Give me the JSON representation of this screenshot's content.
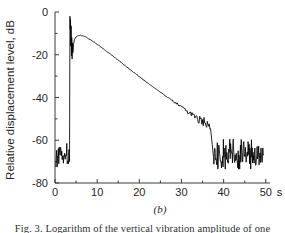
{
  "figure": {
    "panel_label": "(b)",
    "caption": "Fig. 3.  Logarithm of the vertical vibration amplitude of one"
  },
  "chart_data": {
    "type": "line",
    "title": "",
    "subtitle": "",
    "xlabel": "",
    "ylabel": "Relative displacement level, dB",
    "x_unit": "s",
    "xlim": [
      0,
      51
    ],
    "ylim": [
      -80,
      0
    ],
    "xticks": [
      0,
      10,
      20,
      30,
      40,
      50
    ],
    "xtick_labels": [
      "0",
      "10",
      "20",
      "30",
      "40",
      "50"
    ],
    "x_minor_ticks": [
      5,
      15,
      25,
      35,
      45
    ],
    "yticks": [
      0,
      -20,
      -40,
      -60,
      -80
    ],
    "ytick_labels": [
      "0",
      "-20",
      "-40",
      "-60",
      "-80"
    ],
    "y_minor_ticks": [
      -10,
      -30,
      -50,
      -70
    ],
    "grid": false,
    "legend": null,
    "series": [
      {
        "name": "Relative displacement level",
        "description": "Noise floor, sharp onset transient, exponential ring-down decay, return to noise floor",
        "segments": [
          {
            "name": "pre-event-noise-floor",
            "x_range": [
              0.2,
              3.4
            ],
            "noise_center": -67.0,
            "noise_band": [
              -73.0,
              -61.5
            ],
            "sample_step": 0.1
          },
          {
            "name": "onset-spike",
            "points": [
              [
                3.45,
                -70.0
              ],
              [
                3.5,
                -30.0
              ],
              [
                3.55,
                -2.0
              ],
              [
                3.62,
                -8.0
              ],
              [
                3.68,
                -3.5
              ],
              [
                3.75,
                -16.0
              ],
              [
                3.82,
                -6.5
              ],
              [
                3.9,
                -20.5
              ],
              [
                3.98,
                -12.0
              ],
              [
                4.06,
                -22.0
              ],
              [
                4.15,
                -14.5
              ],
              [
                4.25,
                -19.0
              ],
              [
                4.4,
                -15.0
              ],
              [
                4.6,
                -13.0
              ],
              [
                4.9,
                -11.8
              ]
            ]
          },
          {
            "name": "decay",
            "points": [
              [
                4.9,
                -11.8
              ],
              [
                5.4,
                -11.1
              ],
              [
                6.0,
                -10.9
              ],
              [
                6.8,
                -11.2
              ],
              [
                7.6,
                -12.0
              ],
              [
                8.5,
                -13.1
              ],
              [
                9.5,
                -14.4
              ],
              [
                10.5,
                -15.8
              ],
              [
                11.5,
                -17.2
              ],
              [
                12.5,
                -18.7
              ],
              [
                13.5,
                -20.2
              ],
              [
                14.5,
                -21.8
              ],
              [
                15.5,
                -23.3
              ],
              [
                16.5,
                -24.9
              ],
              [
                17.5,
                -26.4
              ],
              [
                18.5,
                -28.0
              ],
              [
                19.5,
                -29.5
              ],
              [
                20.5,
                -31.0
              ],
              [
                21.5,
                -32.5
              ],
              [
                22.5,
                -34.0
              ],
              [
                23.5,
                -35.4
              ],
              [
                24.5,
                -36.8
              ],
              [
                25.5,
                -38.2
              ],
              [
                26.5,
                -39.6
              ],
              [
                27.5,
                -41.0
              ],
              [
                28.5,
                -42.4
              ],
              [
                29.5,
                -43.8
              ],
              [
                30.5,
                -45.2
              ],
              [
                31.5,
                -46.6
              ],
              [
                32.5,
                -48.0
              ],
              [
                33.5,
                -49.4
              ],
              [
                34.5,
                -50.8
              ],
              [
                35.5,
                -52.2
              ],
              [
                36.3,
                -53.4
              ],
              [
                36.9,
                -54.6
              ]
            ],
            "ripple_start_x": 22.0,
            "ripple_max_amplitude": 3.2
          },
          {
            "name": "drop-to-floor",
            "points": [
              [
                36.9,
                -54.6
              ],
              [
                37.3,
                -62.0
              ],
              [
                37.6,
                -68.0
              ]
            ]
          },
          {
            "name": "post-event-noise-floor",
            "x_range": [
              37.6,
              49.5
            ],
            "noise_center": -67.0,
            "noise_band": [
              -73.5,
              -59.5
            ],
            "sample_step": 0.09
          }
        ]
      }
    ],
    "annotations": [
      {
        "text": "(b)",
        "role": "panel-label"
      }
    ]
  }
}
